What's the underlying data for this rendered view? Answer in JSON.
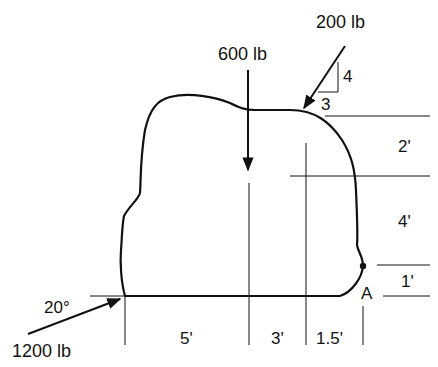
{
  "diagram": {
    "type": "statics free-body problem",
    "colors": {
      "stroke": "#111111",
      "background": "#ffffff"
    },
    "forces": [
      {
        "id": "force-600",
        "label": "600 lb",
        "direction": "vertical downward"
      },
      {
        "id": "force-200",
        "label": "200 lb",
        "slope": {
          "rise": "4",
          "run": "3"
        }
      },
      {
        "id": "force-1200",
        "label": "1200 lb",
        "angle": "20°"
      }
    ],
    "slope_labels": {
      "rise": "4",
      "run": "3"
    },
    "angle_label": "20°",
    "point_label": "A",
    "horizontal_dimensions": [
      "5'",
      "3'",
      "1.5'"
    ],
    "vertical_dimensions": [
      "2'",
      "4'",
      "1'"
    ]
  }
}
